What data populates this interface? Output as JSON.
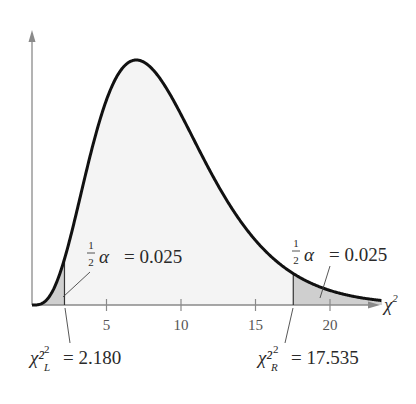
{
  "chart_data": {
    "type": "area",
    "title": "",
    "distribution": "chi-square",
    "degrees_of_freedom": 9,
    "xlabel": "χ²",
    "ylabel": "",
    "xlim": [
      0,
      23.5
    ],
    "x_ticks": [
      5,
      10,
      15,
      20
    ],
    "x_tick_labels": [
      "5",
      "10",
      "15",
      "20"
    ],
    "grid": false,
    "legend": null,
    "critical_values": {
      "left": {
        "symbol": "χ²",
        "subscript": "L",
        "value": 2.18,
        "label": "= 2.180"
      },
      "right": {
        "symbol": "χ²",
        "subscript": "R",
        "value": 17.535,
        "label": "= 17.535"
      }
    },
    "tail_areas": [
      {
        "side": "left",
        "label_prefix": "½α",
        "fraction_num": "1",
        "fraction_den": "2",
        "alpha_symbol": "α",
        "value": 0.025,
        "label": "= 0.025"
      },
      {
        "side": "right",
        "label_prefix": "½α",
        "fraction_num": "1",
        "fraction_den": "2",
        "alpha_symbol": "α",
        "value": 0.025,
        "label": "= 0.025"
      }
    ],
    "colors": {
      "curve": "#111111",
      "center_fill": "#f4f4f4",
      "tail_fill": "#cfcfcf",
      "axis": "#8a8a8a"
    }
  },
  "axis": {
    "x_label_symbol": "χ",
    "x_label_sup": "2"
  }
}
